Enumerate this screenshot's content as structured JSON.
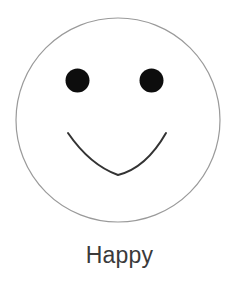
{
  "figure": {
    "caption": "Happy",
    "face": {
      "expression": "smile",
      "outline_color": "#9a9a9a",
      "eye_color": "#0d0d0d",
      "mouth_color": "#333333",
      "background": "#ffffff"
    }
  }
}
